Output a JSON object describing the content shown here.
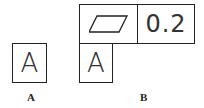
{
  "figure_a": {
    "datum_label": "A",
    "caption": "A"
  },
  "figure_b": {
    "symbol": "flatness-parallelogram",
    "tolerance": "0.2",
    "datum_label": "A",
    "caption": "B"
  }
}
